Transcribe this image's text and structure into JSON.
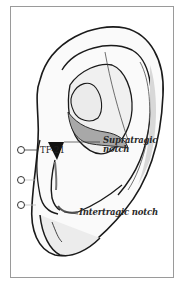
{
  "figure": {
    "labels": {
      "supratragic_notch": "Supratragic\nnotch",
      "supratragic_line1": "Supratragic",
      "supratragic_line2": "notch",
      "intertragic_notch": "Intertragic notch"
    },
    "points": [
      {
        "id": "point-1",
        "label": "TF-21",
        "visible_text": true
      },
      {
        "id": "point-2",
        "label": "",
        "visible_text": false
      },
      {
        "id": "point-3",
        "label": "",
        "visible_text": false
      }
    ],
    "colors": {
      "outline": "#1a1a1a",
      "shade": "#9c9c9c",
      "light_shade": "#e6e6e6",
      "frame": "#9a9a9a"
    }
  }
}
